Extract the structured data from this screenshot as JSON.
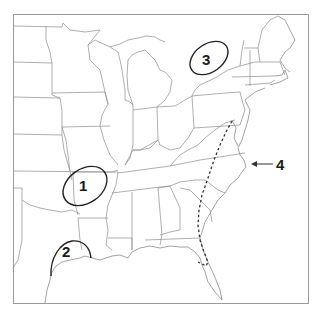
{
  "map": {
    "title": "Eastern United States outline map",
    "region": "Eastern United States",
    "colors": {
      "background": "#ffffff",
      "state_lines": "#8c8c8c",
      "markers": "#222222",
      "frame": "#9a9a9a"
    },
    "markers": [
      {
        "id": 1,
        "label": "1",
        "type": "ellipse",
        "location": "Oklahoma / Arkansas border region"
      },
      {
        "id": 2,
        "label": "2",
        "type": "semi-ellipse",
        "location": "Texas Gulf coast"
      },
      {
        "id": 3,
        "label": "3",
        "type": "ellipse",
        "location": "Lake Ontario / southern Ontario region"
      },
      {
        "id": 4,
        "label": "4",
        "type": "arrow",
        "location": "Outer Banks, North Carolina coast"
      }
    ],
    "route": {
      "style": "dashed",
      "description": "Dashed line from Pennsylvania/Maryland south through Virginia, the Carolinas, Georgia into central Florida"
    }
  }
}
